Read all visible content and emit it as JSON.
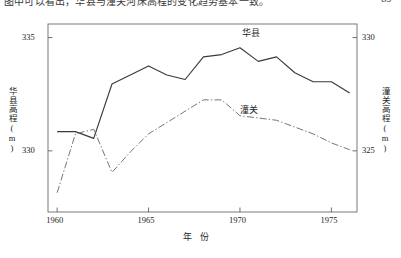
{
  "page": {
    "top_caption": "图中可以看出，华县与潼关河床高程的变化趋势基本一致。",
    "page_number": "· 85 ·"
  },
  "chart_data": {
    "type": "line",
    "title": "",
    "xlabel": "年 份",
    "ylabel_left": "华县高程(m)",
    "ylabel_right": "潼关高程(m)",
    "xlim": [
      1959.5,
      1976.4
    ],
    "xticks": [
      1960,
      1965,
      1970,
      1975
    ],
    "xticklabels": [
      "1960",
      "1965",
      "1970",
      "1975"
    ],
    "ylim_left": [
      327.3,
      335.6
    ],
    "yticks_left": [
      330,
      335
    ],
    "yticklabels_left": [
      "330",
      "335"
    ],
    "ylim_right": [
      322.3,
      330.6
    ],
    "yticks_right": [
      325,
      330
    ],
    "yticklabels_right": [
      "325",
      "330"
    ],
    "grid": false,
    "legend": "inline-annotation",
    "series": [
      {
        "name": "华县",
        "axis": "left",
        "style": "solid",
        "color": "#3a3a3a",
        "label_x": 1970.1,
        "label_y": 335.25,
        "x": [
          1960,
          1961,
          1962,
          1963,
          1964,
          1965,
          1966,
          1967,
          1968,
          1969,
          1970,
          1971,
          1972,
          1973,
          1974,
          1975,
          1976
        ],
        "values": [
          330.85,
          330.85,
          330.55,
          332.95,
          333.35,
          333.75,
          333.35,
          333.15,
          334.15,
          334.25,
          334.55,
          333.95,
          334.15,
          333.45,
          333.05,
          333.05,
          332.55
        ]
      },
      {
        "name": "潼关",
        "axis": "right",
        "style": "dashdot",
        "color": "#6e6e6e",
        "label_x": 1970.0,
        "label_y": 326.85,
        "x": [
          1960,
          1961,
          1962,
          1963,
          1964,
          1965,
          1966,
          1967,
          1968,
          1969,
          1970,
          1971,
          1972,
          1973,
          1974,
          1975,
          1976
        ],
        "values": [
          323.15,
          325.75,
          325.95,
          324.05,
          324.95,
          325.75,
          326.25,
          326.75,
          327.25,
          327.25,
          326.55,
          326.45,
          326.35,
          326.05,
          325.75,
          325.35,
          325.05
        ]
      }
    ]
  }
}
